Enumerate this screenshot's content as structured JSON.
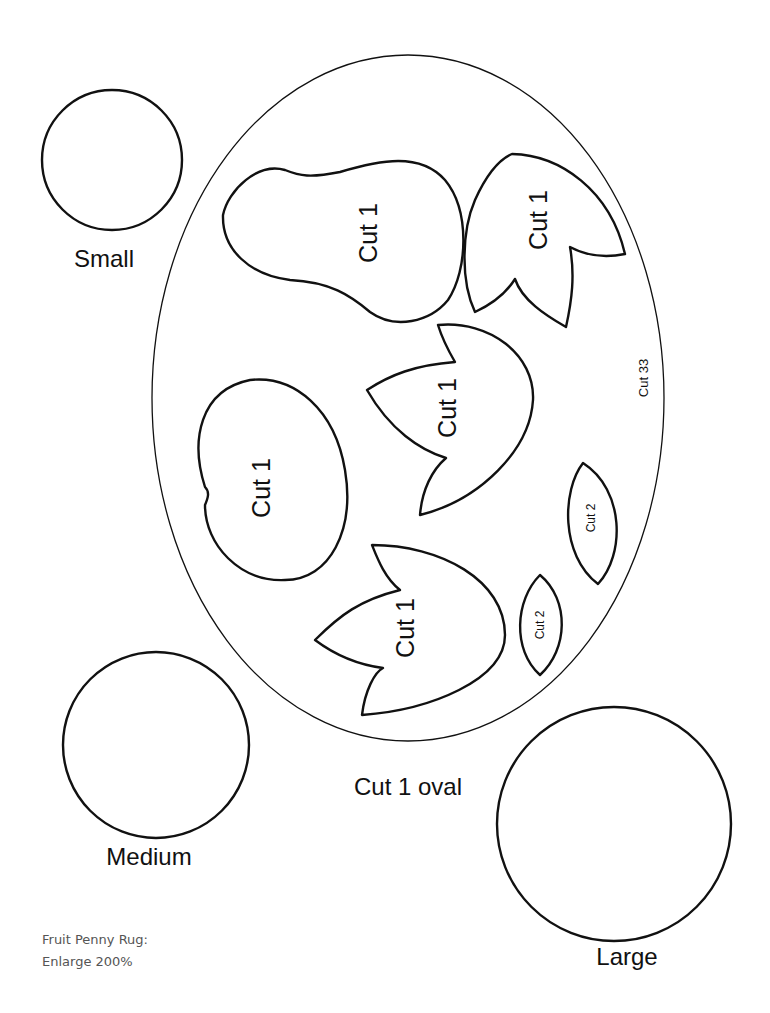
{
  "document": {
    "title": "Fruit Penny Rug",
    "note_line1": "Fruit Penny Rug:",
    "note_line2": "Enlarge 200%"
  },
  "circles": {
    "small": {
      "label": "Small"
    },
    "medium": {
      "label": "Medium"
    },
    "large": {
      "label": "Large"
    }
  },
  "oval": {
    "label": "Cut 1 oval",
    "side_label": "Cut 33"
  },
  "shapes": {
    "pear": {
      "label": "Cut 1"
    },
    "leaf_top_right": {
      "label": "Cut 1"
    },
    "leaf_middle": {
      "label": "Cut 1"
    },
    "apple": {
      "label": "Cut 1"
    },
    "leaf_bottom": {
      "label": "Cut 1"
    },
    "small_leaf_right": {
      "label": "Cut 2"
    },
    "small_leaf_left": {
      "label": "Cut 2"
    }
  },
  "colors": {
    "stroke": "#111111",
    "note_text": "#555555",
    "background": "#ffffff"
  }
}
